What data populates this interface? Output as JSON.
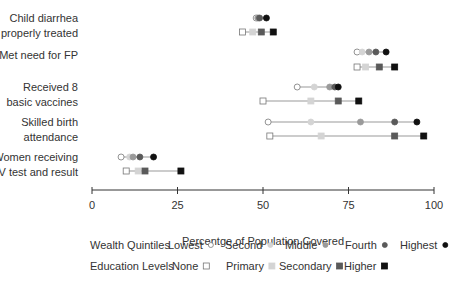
{
  "chart_data": {
    "type": "scatter",
    "subtype": "dot-range",
    "title": "",
    "xlabel": "Percentge of Population Covered",
    "ylabel": "",
    "xlim": [
      0,
      100
    ],
    "xticks": [
      0,
      25,
      50,
      75,
      100
    ],
    "grid": false,
    "categories": [
      "Child diarrhea properly treated",
      "Met need for FP",
      "Received 8 basic vaccines",
      "Skilled birth attendance",
      "Women receiving HIV test and result"
    ],
    "category_lines": [
      [
        "Child diarrhea",
        "properly treated"
      ],
      [
        "Met need for FP"
      ],
      [
        "Received 8",
        "basic vaccines"
      ],
      [
        "Skilled birth",
        "attendance"
      ],
      [
        "Women receiving",
        "HIV test and result"
      ]
    ],
    "groups": [
      {
        "name": "Wealth Quintiles",
        "marker": "circle",
        "series": [
          {
            "name": "Lowest",
            "color": "#ffffff",
            "values": [
              48,
              77.5,
              60,
              51.5,
              8.5
            ]
          },
          {
            "name": "Second",
            "color": "#d4d4d4",
            "values": [
              48.5,
              79,
              65,
              64,
              11
            ]
          },
          {
            "name": "Middle",
            "color": "#9a9a9a",
            "values": [
              48.5,
              81,
              69.5,
              78.5,
              12
            ]
          },
          {
            "name": "Fourth",
            "color": "#5a5a5a",
            "values": [
              49,
              83,
              71,
              88.5,
              14
            ]
          },
          {
            "name": "Highest",
            "color": "#111111",
            "values": [
              51,
              86,
              72,
              95,
              18
            ]
          }
        ]
      },
      {
        "name": "Education Levels",
        "marker": "square",
        "series": [
          {
            "name": "None",
            "color": "#ffffff",
            "values": [
              44,
              77.5,
              50,
              52,
              10
            ]
          },
          {
            "name": "Primary",
            "color": "#d4d4d4",
            "values": [
              47,
              80,
              64,
              67,
              13.5
            ]
          },
          {
            "name": "Secondary",
            "color": "#5a5a5a",
            "values": [
              49.5,
              84,
              72,
              88.5,
              15.5
            ]
          },
          {
            "name": "Higher",
            "color": "#111111",
            "values": [
              53,
              88.5,
              78,
              97,
              26
            ]
          }
        ]
      }
    ],
    "legend_position": "bottom"
  },
  "legend": {
    "wealth_title": "Wealth Quintiles",
    "education_title": "Education Levels"
  }
}
